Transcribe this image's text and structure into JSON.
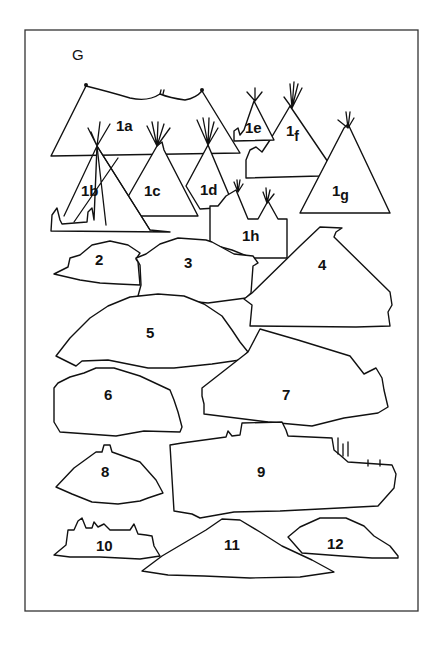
{
  "figure": {
    "panel_label": "G",
    "colors": {
      "line": "#111111",
      "background": "#ffffff",
      "frame": "#333333"
    },
    "shapes": [
      {
        "id": "1a",
        "num": "1",
        "suffix": "a",
        "kind": "tent"
      },
      {
        "id": "1b",
        "num": "1",
        "suffix": "b",
        "kind": "tipi"
      },
      {
        "id": "1c",
        "num": "1",
        "suffix": "c",
        "kind": "tipi"
      },
      {
        "id": "1d",
        "num": "1",
        "suffix": "d",
        "kind": "tipi"
      },
      {
        "id": "1e",
        "num": "1",
        "suffix": "e",
        "kind": "tipi"
      },
      {
        "id": "1f",
        "num": "1",
        "suffix": "f",
        "kind": "tipi"
      },
      {
        "id": "1g",
        "num": "1",
        "suffix": "g",
        "kind": "tipi"
      },
      {
        "id": "1h",
        "num": "1",
        "suffix": "h",
        "kind": "tipi-pair"
      },
      {
        "id": "2",
        "num": "2",
        "kind": "silhouette"
      },
      {
        "id": "3",
        "num": "3",
        "kind": "silhouette"
      },
      {
        "id": "4",
        "num": "4",
        "kind": "silhouette"
      },
      {
        "id": "5",
        "num": "5",
        "kind": "dome"
      },
      {
        "id": "6",
        "num": "6",
        "kind": "silhouette"
      },
      {
        "id": "7",
        "num": "7",
        "kind": "silhouette"
      },
      {
        "id": "8",
        "num": "8",
        "kind": "silhouette"
      },
      {
        "id": "9",
        "num": "9",
        "kind": "silhouette"
      },
      {
        "id": "10",
        "num": "10",
        "kind": "silhouette"
      },
      {
        "id": "11",
        "num": "11",
        "kind": "mound"
      },
      {
        "id": "12",
        "num": "12",
        "kind": "silhouette"
      }
    ]
  }
}
